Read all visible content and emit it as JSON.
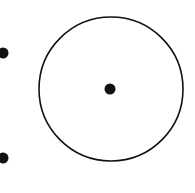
{
  "diagram": {
    "background": "#ffffff",
    "stroke_color": "#111111",
    "circle": {
      "cx": 111,
      "cy": 89,
      "r": 72,
      "stroke_width": 1.6
    },
    "center_point": {
      "cx": 110,
      "cy": 89,
      "r": 5.5
    },
    "external_points": [
      {
        "cx": 3,
        "cy": 53,
        "r": 5.5
      },
      {
        "cx": 3,
        "cy": 158,
        "r": 5.5
      }
    ]
  }
}
